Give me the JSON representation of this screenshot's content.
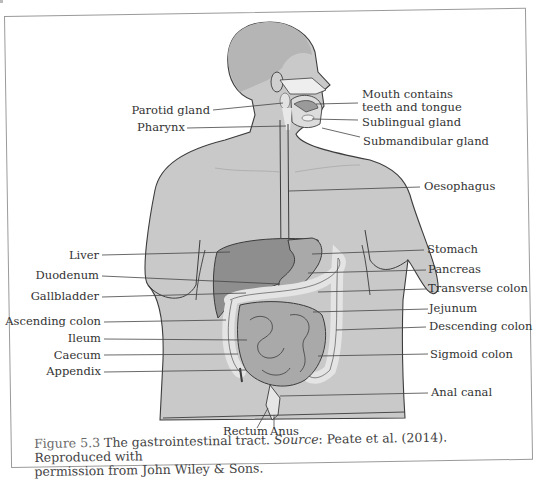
{
  "figure": {
    "number": "Figure 5.3",
    "title_text": "The gastrointestinal tract.",
    "source_label": "Source",
    "source_text": ": Peate et al. (2014). Reproduced with",
    "line2": "permission from John Wiley & Sons."
  },
  "labels": {
    "left": [
      {
        "id": "parotid-gland",
        "text": "Parotid gland"
      },
      {
        "id": "pharynx",
        "text": "Pharynx"
      },
      {
        "id": "liver",
        "text": "Liver"
      },
      {
        "id": "duodenum",
        "text": "Duodenum"
      },
      {
        "id": "gallbladder",
        "text": "Gallbladder"
      },
      {
        "id": "ascending-colon",
        "text": "Ascending colon"
      },
      {
        "id": "ileum",
        "text": "Ileum"
      },
      {
        "id": "caecum",
        "text": "Caecum"
      },
      {
        "id": "appendix",
        "text": "Appendix"
      }
    ],
    "right": [
      {
        "id": "mouth",
        "text": "Mouth contains"
      },
      {
        "id": "mouth-2",
        "text": "teeth and tongue"
      },
      {
        "id": "sublingual-gland",
        "text": "Sublingual gland"
      },
      {
        "id": "submandibular-gland",
        "text": "Submandibular gland"
      },
      {
        "id": "oesophagus",
        "text": "Oesophagus"
      },
      {
        "id": "stomach",
        "text": "Stomach"
      },
      {
        "id": "pancreas",
        "text": "Pancreas"
      },
      {
        "id": "transverse-colon",
        "text": "Transverse colon"
      },
      {
        "id": "jejunum",
        "text": "Jejunum"
      },
      {
        "id": "descending-colon",
        "text": "Descending colon"
      },
      {
        "id": "sigmoid-colon",
        "text": "Sigmoid colon"
      },
      {
        "id": "anal-canal",
        "text": "Anal canal"
      }
    ],
    "bottom": [
      {
        "id": "rectum",
        "text": "Rectum"
      },
      {
        "id": "anus",
        "text": "Anus"
      }
    ]
  },
  "colors": {
    "body": "#c9c9c9",
    "body_dark": "#b8b8b8",
    "liver": "#8e8e8e",
    "organ": "#a9a9a9",
    "colon": "#e6e6e6",
    "outline": "#3c3c3c",
    "leader": "#444444"
  }
}
